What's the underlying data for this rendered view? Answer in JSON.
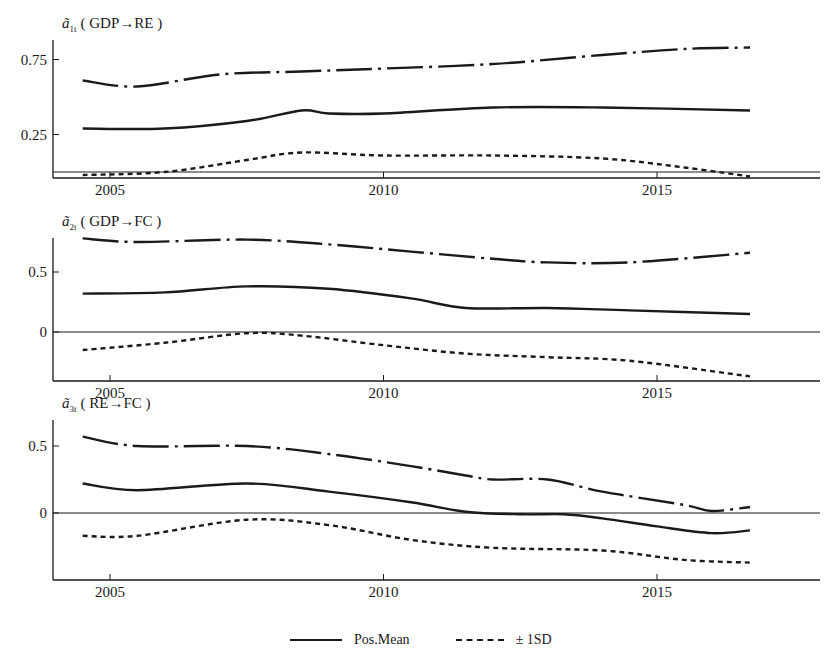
{
  "chart_data": [
    {
      "type": "line",
      "title": "ã1t ( GDP→RE )",
      "title_var": "a",
      "title_sub": "1t",
      "title_text": "( GDP→RE )",
      "xlabel": "",
      "ylabel": "",
      "xlim": [
        2004.0,
        2018.0
      ],
      "ylim": [
        -0.04,
        0.9
      ],
      "xticks": [
        2005,
        2010,
        2015
      ],
      "xtick_labels": [
        "2005",
        "2010",
        "2015"
      ],
      "yticks": [
        0.25,
        0.75
      ],
      "ytick_labels": [
        "0.25",
        "0.75"
      ],
      "zero_line": true,
      "grid": false,
      "series": [
        {
          "name": "+1SD",
          "style": "dashdot",
          "x": [
            2004.5,
            2005.5,
            2007,
            2008.5,
            2010,
            2012,
            2014,
            2015.5,
            2016.7
          ],
          "values": [
            0.61,
            0.57,
            0.65,
            0.67,
            0.69,
            0.72,
            0.78,
            0.82,
            0.83
          ]
        },
        {
          "name": "Pos.Mean",
          "style": "solid",
          "x": [
            2004.5,
            2006,
            2007.5,
            2008.5,
            2009,
            2010,
            2012,
            2014,
            2016.7
          ],
          "values": [
            0.29,
            0.29,
            0.34,
            0.41,
            0.39,
            0.39,
            0.43,
            0.43,
            0.41
          ]
        },
        {
          "name": "-1SD",
          "style": "dashed",
          "x": [
            2004.5,
            2006,
            2007.5,
            2008.5,
            2010,
            2012,
            2014,
            2015.5,
            2016.7
          ],
          "values": [
            -0.02,
            0.0,
            0.08,
            0.13,
            0.11,
            0.11,
            0.09,
            0.03,
            -0.03
          ]
        }
      ]
    },
    {
      "type": "line",
      "title": "ã2t ( GDP→FC )",
      "title_var": "a",
      "title_sub": "2t",
      "title_text": "( GDP→FC )",
      "xlabel": "",
      "ylabel": "",
      "xlim": [
        2004.0,
        2018.0
      ],
      "ylim": [
        -0.41,
        0.77
      ],
      "xticks": [
        2005,
        2010,
        2015
      ],
      "xtick_labels": [
        "2005",
        "2010",
        "2015"
      ],
      "yticks": [
        0,
        0.5
      ],
      "ytick_labels": [
        "0",
        "0.5"
      ],
      "zero_line": true,
      "grid": false,
      "series": [
        {
          "name": "+1SD",
          "style": "dashdot",
          "x": [
            2004.5,
            2005.5,
            2007.5,
            2009,
            2010.5,
            2012,
            2013,
            2014.5,
            2016.7
          ],
          "values": [
            0.78,
            0.75,
            0.77,
            0.73,
            0.67,
            0.61,
            0.58,
            0.58,
            0.66
          ]
        },
        {
          "name": "Pos.Mean",
          "style": "solid",
          "x": [
            2004.5,
            2006,
            2007.5,
            2009,
            2010.5,
            2011.5,
            2013,
            2014.5,
            2016.7
          ],
          "values": [
            0.32,
            0.33,
            0.38,
            0.36,
            0.28,
            0.2,
            0.2,
            0.18,
            0.15
          ]
        },
        {
          "name": "-1SD",
          "style": "dashed",
          "x": [
            2004.5,
            2006,
            2007.5,
            2008.5,
            2010,
            2011.5,
            2013,
            2014.5,
            2016.7
          ],
          "values": [
            -0.15,
            -0.09,
            -0.01,
            -0.03,
            -0.11,
            -0.18,
            -0.21,
            -0.24,
            -0.37
          ]
        }
      ]
    },
    {
      "type": "line",
      "title": "ã3t ( RE→FC )",
      "title_var": "a",
      "title_sub": "3t",
      "title_text": "( RE→FC )",
      "xlabel": "",
      "ylabel": "",
      "xlim": [
        2004.0,
        2018.0
      ],
      "ylim": [
        -0.5,
        0.6
      ],
      "xticks": [
        2005,
        2010,
        2015
      ],
      "xtick_labels": [
        "2005",
        "2010",
        "2015"
      ],
      "yticks": [
        0,
        0.5
      ],
      "ytick_labels": [
        "0",
        "0.5"
      ],
      "zero_line": true,
      "grid": false,
      "series": [
        {
          "name": "+1SD",
          "style": "dashdot",
          "x": [
            2004.5,
            2005.5,
            2007.5,
            2009,
            2010.5,
            2011.5,
            2012,
            2013,
            2014,
            2015.5,
            2016,
            2016.7
          ],
          "values": [
            0.57,
            0.5,
            0.5,
            0.44,
            0.35,
            0.28,
            0.25,
            0.25,
            0.16,
            0.06,
            0.015,
            0.045
          ]
        },
        {
          "name": "Pos.Mean",
          "style": "solid",
          "x": [
            2004.5,
            2005.5,
            2007.5,
            2009,
            2010.5,
            2011.5,
            2012.5,
            2013.3,
            2014,
            2015,
            2016,
            2016.7
          ],
          "values": [
            0.22,
            0.17,
            0.22,
            0.16,
            0.08,
            0.01,
            -0.01,
            -0.01,
            -0.04,
            -0.1,
            -0.15,
            -0.13
          ]
        },
        {
          "name": "-1SD",
          "style": "dashed",
          "x": [
            2004.5,
            2005.5,
            2007.5,
            2009,
            2010.5,
            2012,
            2014,
            2015.5,
            2016.7
          ],
          "values": [
            -0.17,
            -0.17,
            -0.05,
            -0.09,
            -0.2,
            -0.26,
            -0.28,
            -0.35,
            -0.37
          ]
        }
      ]
    }
  ],
  "legend": {
    "position": "bottom-center",
    "items": [
      {
        "label": "Pos.Mean",
        "style": "solid"
      },
      {
        "label": "± 1SD",
        "style": "dashed"
      }
    ]
  },
  "layout": {
    "panels": [
      {
        "top": 40,
        "bottom": 178,
        "y_zero": 172,
        "px_per_unit": 150
      },
      {
        "top": 238,
        "bottom": 381,
        "y_zero": 332,
        "px_per_unit": 120
      },
      {
        "top": 420,
        "bottom": 580,
        "y_zero": 513,
        "px_per_unit": 134
      }
    ],
    "axis_left": 53,
    "axis_right": 820,
    "x_origin_year": 2005,
    "x_origin_px": 110,
    "px_per_year": 54.7,
    "ink_color": "#1a1a1a"
  }
}
